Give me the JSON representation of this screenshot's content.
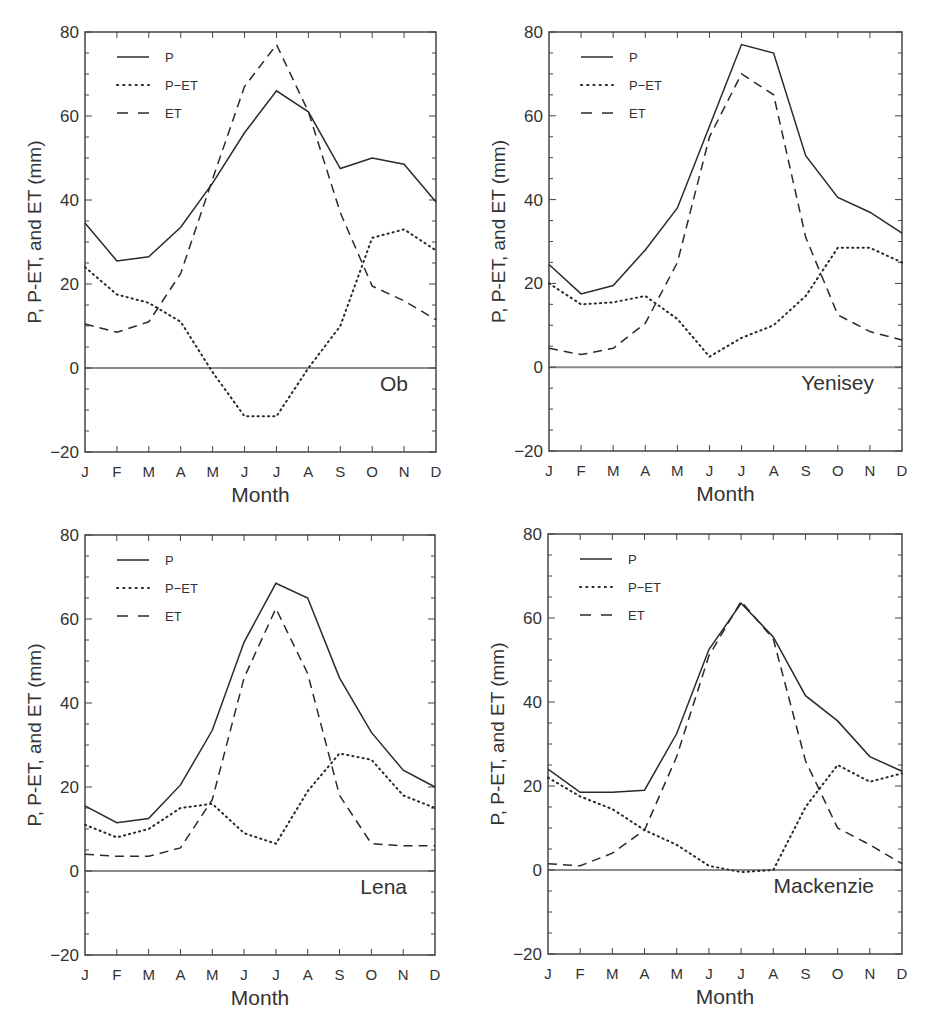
{
  "figure": {
    "months": [
      "J",
      "F",
      "M",
      "A",
      "M",
      "J",
      "J",
      "A",
      "S",
      "O",
      "N",
      "D"
    ],
    "xlabel": "Month",
    "ylabel": "P, P-ET, and ET (mm)",
    "yticks": [
      80,
      60,
      40,
      20,
      0,
      -20
    ],
    "legend": [
      {
        "key": "P",
        "label": "P",
        "style": "solid"
      },
      {
        "key": "PET",
        "label": "P−ET",
        "style": "dotted"
      },
      {
        "key": "ET",
        "label": "ET",
        "style": "dashed"
      }
    ],
    "colors": {
      "line": "#2a2a2a",
      "axis": "#444444",
      "zero_line": "#8a8a8a",
      "text": "#333333"
    }
  },
  "chart_data": [
    {
      "type": "line",
      "title": "Ob",
      "xlabel": "Month",
      "ylabel": "P, P-ET, and ET (mm)",
      "ylim": [
        -20,
        80
      ],
      "grid": false,
      "legend_position": "upper-left",
      "categories": [
        "J",
        "F",
        "M",
        "A",
        "M",
        "J",
        "J",
        "A",
        "S",
        "O",
        "N",
        "D"
      ],
      "series": [
        {
          "name": "P",
          "style": "solid",
          "values": [
            34.5,
            25.5,
            26.5,
            33.5,
            44,
            56,
            66,
            61,
            47.5,
            50,
            48.5,
            39.5
          ]
        },
        {
          "name": "P-ET",
          "style": "dotted",
          "values": [
            24,
            17.5,
            15.5,
            11,
            -1,
            -11.5,
            -11.5,
            0,
            10,
            31,
            33,
            28
          ]
        },
        {
          "name": "ET",
          "style": "dashed",
          "values": [
            10.5,
            8.5,
            11,
            22.5,
            45,
            67,
            77,
            61,
            37,
            19.5,
            16,
            11.5
          ]
        }
      ]
    },
    {
      "type": "line",
      "title": "Yenisey",
      "xlabel": "Month",
      "ylabel": "P, P-ET, and ET (mm)",
      "ylim": [
        -20,
        80
      ],
      "grid": false,
      "legend_position": "upper-left",
      "categories": [
        "J",
        "F",
        "M",
        "A",
        "M",
        "J",
        "J",
        "A",
        "S",
        "O",
        "N",
        "D"
      ],
      "series": [
        {
          "name": "P",
          "style": "solid",
          "values": [
            24.5,
            17.5,
            19.5,
            28,
            38,
            57.5,
            77,
            75,
            50.5,
            40.5,
            37,
            32
          ]
        },
        {
          "name": "P-ET",
          "style": "dotted",
          "values": [
            20,
            15,
            15.5,
            17,
            11.5,
            2.5,
            7,
            10,
            17,
            28.5,
            28.5,
            25
          ]
        },
        {
          "name": "ET",
          "style": "dashed",
          "values": [
            4.5,
            3,
            4.5,
            10.5,
            25,
            55,
            70,
            65,
            31,
            12.5,
            8.5,
            6.5
          ]
        }
      ]
    },
    {
      "type": "line",
      "title": "Lena",
      "xlabel": "Month",
      "ylabel": "P, P-ET, and ET (mm)",
      "ylim": [
        -20,
        80
      ],
      "grid": false,
      "legend_position": "upper-left",
      "categories": [
        "J",
        "F",
        "M",
        "A",
        "M",
        "J",
        "J",
        "A",
        "S",
        "O",
        "N",
        "D"
      ],
      "series": [
        {
          "name": "P",
          "style": "solid",
          "values": [
            15.5,
            11.5,
            12.5,
            20.5,
            33.5,
            54.5,
            68.5,
            65,
            46,
            33,
            24,
            20
          ]
        },
        {
          "name": "P-ET",
          "style": "dotted",
          "values": [
            11,
            8,
            10,
            15,
            16,
            9,
            6.5,
            19,
            28,
            26.5,
            18,
            15
          ]
        },
        {
          "name": "ET",
          "style": "dashed",
          "values": [
            4,
            3.5,
            3.5,
            5.5,
            17,
            46,
            62.5,
            47,
            18,
            6.5,
            6,
            6
          ]
        }
      ]
    },
    {
      "type": "line",
      "title": "Mackenzie",
      "xlabel": "Month",
      "ylabel": "P, P-ET, and ET (mm)",
      "ylim": [
        -20,
        80
      ],
      "grid": false,
      "legend_position": "upper-left",
      "categories": [
        "J",
        "F",
        "M",
        "A",
        "M",
        "J",
        "J",
        "A",
        "S",
        "O",
        "N",
        "D"
      ],
      "series": [
        {
          "name": "P",
          "style": "solid",
          "values": [
            24,
            18.5,
            18.5,
            19,
            32.5,
            52.5,
            63.5,
            55.5,
            41.5,
            35.5,
            27,
            23.5
          ]
        },
        {
          "name": "P-ET",
          "style": "dotted",
          "values": [
            22,
            17.5,
            14.5,
            9.5,
            6,
            1,
            -0.5,
            0,
            15,
            25,
            21,
            23
          ]
        },
        {
          "name": "ET",
          "style": "dashed",
          "values": [
            1.5,
            1,
            4,
            9.5,
            27,
            51,
            64,
            55,
            26,
            10,
            6,
            1.5
          ]
        }
      ]
    }
  ],
  "layout": {
    "panels": [
      {
        "x0": 85,
        "x1": 436,
        "ytop": 32,
        "ybot": 452
      },
      {
        "x0": 549,
        "x1": 902,
        "ytop": 32,
        "ybot": 451
      },
      {
        "x0": 85,
        "x1": 435,
        "ytop": 535,
        "ybot": 955
      },
      {
        "x0": 548,
        "x1": 902,
        "ytop": 534,
        "ybot": 954
      }
    ]
  }
}
